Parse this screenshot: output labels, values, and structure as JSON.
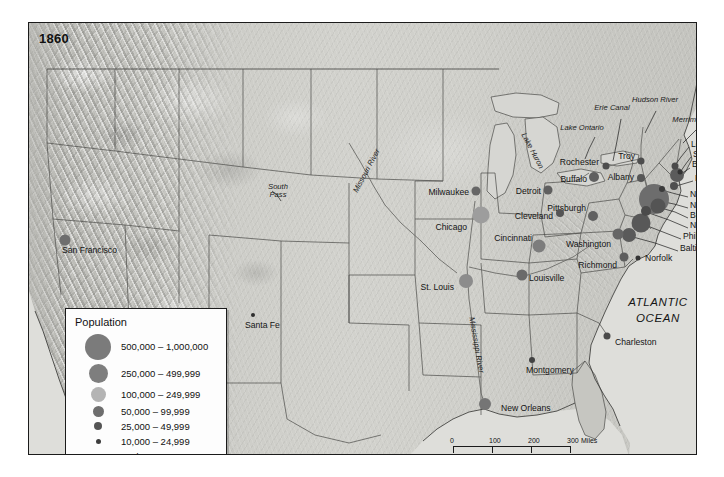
{
  "map": {
    "year_label": "1860",
    "ocean_label_line1": "ATLANTIC",
    "ocean_label_line2": "OCEAN"
  },
  "legend": {
    "title": "Population",
    "classes": [
      {
        "label": "500,000 – 1,000,000",
        "size": 26,
        "color": "#7b7b7b"
      },
      {
        "label": "250,000 – 499,999",
        "size": 19,
        "color": "#7e7e7e"
      },
      {
        "label": "100,000 – 249,999",
        "size": 15,
        "color": "#b4b4b4"
      },
      {
        "label": "50,000 – 99,999",
        "size": 11,
        "color": "#6e6e6e"
      },
      {
        "label": "25,000 – 49,999",
        "size": 8,
        "color": "#555555"
      },
      {
        "label": "10,000 – 24,999",
        "size": 5,
        "color": "#3d3d3d"
      },
      {
        "label": "Under 10,000",
        "size": 3,
        "color": "#222222"
      }
    ]
  },
  "scale": {
    "miles_ticks": [
      "0",
      "100",
      "200",
      "300"
    ],
    "miles_unit": "Miles",
    "km_ticks": [
      "0",
      "100",
      "200",
      "300"
    ],
    "km_unit": "Kilometers"
  },
  "cities": [
    {
      "name": "San Francisco",
      "x": 36,
      "y": 217,
      "size": 11,
      "color": "#6e6e6e",
      "lx": 33,
      "ly": 228,
      "anchor": "start"
    },
    {
      "name": "Santa Fe",
      "x": 224,
      "y": 292,
      "size": 4,
      "color": "#2e2e2e",
      "lx": 216,
      "ly": 303,
      "anchor": "start"
    },
    {
      "name": "Milwaukee",
      "x": 447,
      "y": 168,
      "size": 9,
      "color": "#666666",
      "lx": 440,
      "ly": 170,
      "anchor": "end"
    },
    {
      "name": "Chicago",
      "x": 452,
      "y": 192,
      "size": 17,
      "color": "#9d9d9d",
      "lx": 438,
      "ly": 205,
      "anchor": "end"
    },
    {
      "name": "St. Louis",
      "x": 437,
      "y": 258,
      "size": 14,
      "color": "#8c8c8c",
      "lx": 425,
      "ly": 265,
      "anchor": "end"
    },
    {
      "name": "Detroit",
      "x": 519,
      "y": 167,
      "size": 9,
      "color": "#5f5f5f",
      "lx": 512,
      "ly": 169,
      "anchor": "end"
    },
    {
      "name": "Cleveland",
      "x": 531,
      "y": 190,
      "size": 8,
      "color": "#555555",
      "lx": 524,
      "ly": 194,
      "anchor": "end"
    },
    {
      "name": "Cincinnati",
      "x": 510,
      "y": 223,
      "size": 13,
      "color": "#7d7d7d",
      "lx": 503,
      "ly": 216,
      "anchor": "end"
    },
    {
      "name": "Louisville",
      "x": 493,
      "y": 252,
      "size": 11,
      "color": "#6a6a6a",
      "lx": 500,
      "ly": 256,
      "anchor": "start"
    },
    {
      "name": "Pittsburgh",
      "x": 564,
      "y": 193,
      "size": 10,
      "color": "#616161",
      "lx": 557,
      "ly": 186,
      "anchor": "end"
    },
    {
      "name": "Washington",
      "x": 589,
      "y": 211,
      "size": 11,
      "color": "#656565",
      "lx": 582,
      "ly": 222,
      "anchor": "end"
    },
    {
      "name": "Richmond",
      "x": 595,
      "y": 234,
      "size": 9,
      "color": "#5e5e5e",
      "lx": 588,
      "ly": 243,
      "anchor": "end"
    },
    {
      "name": "Norfolk",
      "x": 609,
      "y": 235,
      "size": 5,
      "color": "#333333",
      "lx": 616,
      "ly": 236,
      "anchor": "start"
    },
    {
      "name": "Charleston",
      "x": 578,
      "y": 313,
      "size": 7,
      "color": "#4a4a4a",
      "lx": 586,
      "ly": 320,
      "anchor": "start"
    },
    {
      "name": "Montgomery",
      "x": 503,
      "y": 337,
      "size": 6,
      "color": "#424242",
      "lx": 497,
      "ly": 348,
      "anchor": "start"
    },
    {
      "name": "New Orleans",
      "x": 456,
      "y": 381,
      "size": 12,
      "color": "#757575",
      "lx": 472,
      "ly": 386,
      "anchor": "start"
    },
    {
      "name": "Rochester",
      "x": 577,
      "y": 143,
      "size": 7,
      "color": "#4e4e4e",
      "lx": 570,
      "ly": 140,
      "anchor": "end"
    },
    {
      "name": "Buffalo",
      "x": 565,
      "y": 154,
      "size": 10,
      "color": "#606060",
      "lx": 558,
      "ly": 157,
      "anchor": "end"
    },
    {
      "name": "Troy",
      "x": 612,
      "y": 138,
      "size": 7,
      "color": "#4d4d4d",
      "lx": 606,
      "ly": 134,
      "anchor": "end"
    },
    {
      "name": "Albany",
      "x": 612,
      "y": 155,
      "size": 8,
      "color": "#565656",
      "lx": 605,
      "ly": 155,
      "anchor": "end"
    },
    {
      "name": "Lowell",
      "x": 646,
      "y": 143,
      "size": 7,
      "color": "#4a4a4a",
      "lx": 662,
      "ly": 122,
      "anchor": "start"
    },
    {
      "name": "Salem",
      "x": 651,
      "y": 149,
      "size": 5,
      "color": "#333333",
      "lx": 664,
      "ly": 132,
      "anchor": "start"
    },
    {
      "name": "Boston",
      "x": 648,
      "y": 152,
      "size": 14,
      "color": "#5b5b5b",
      "lx": 663,
      "ly": 142,
      "anchor": "start"
    },
    {
      "name": "Providence",
      "x": 645,
      "y": 163,
      "size": 8,
      "color": "#4f4f4f",
      "lx": 666,
      "ly": 156,
      "anchor": "start"
    },
    {
      "name": "New Haven",
      "x": 633,
      "y": 166,
      "size": 6,
      "color": "#3b3b3b",
      "lx": 661,
      "ly": 172,
      "anchor": "start"
    },
    {
      "name": "New York",
      "x": 625,
      "y": 176,
      "size": 30,
      "color": "#6d6d6d",
      "lx": 661,
      "ly": 183,
      "anchor": "start"
    },
    {
      "name": "Brooklyn",
      "x": 629,
      "y": 183,
      "size": 15,
      "color": "#545454",
      "lx": 661,
      "ly": 193,
      "anchor": "start"
    },
    {
      "name": "Newark",
      "x": 617,
      "y": 188,
      "size": 10,
      "color": "#4b4b4b",
      "lx": 661,
      "ly": 203,
      "anchor": "start"
    },
    {
      "name": "Philadelphia",
      "x": 612,
      "y": 200,
      "size": 19,
      "color": "#585858",
      "lx": 654,
      "ly": 214,
      "anchor": "start"
    },
    {
      "name": "Baltimore",
      "x": 600,
      "y": 212,
      "size": 14,
      "color": "#5a5a5a",
      "lx": 651,
      "ly": 226,
      "anchor": "start"
    }
  ],
  "features": [
    {
      "name": "South Pass",
      "text": "South\nPass",
      "x": 249,
      "y": 168
    },
    {
      "name": "Missouri River",
      "text": "Missouri River",
      "x": 338,
      "y": 148,
      "rotate": -62
    },
    {
      "name": "Mississippi River",
      "text": "Mississippi River",
      "x": 447,
      "y": 322,
      "rotate": 80
    },
    {
      "name": "Lake Huron",
      "text": "Lake Huron",
      "x": 503,
      "y": 128,
      "rotate": 62
    },
    {
      "name": "Lake Ontario",
      "text": "Lake Ontario",
      "x": 553,
      "y": 105
    },
    {
      "name": "Erie Canal",
      "text": "Erie Canal",
      "x": 583,
      "y": 85
    },
    {
      "name": "Hudson River",
      "text": "Hudson River",
      "x": 626,
      "y": 77
    },
    {
      "name": "Merrimack River",
      "text": "Merrimack River",
      "x": 671,
      "y": 97
    }
  ]
}
